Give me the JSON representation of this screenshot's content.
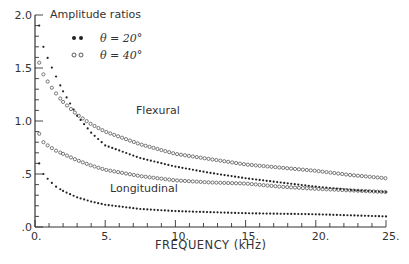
{
  "chart_data": {
    "type": "scatter",
    "title": "",
    "xlabel": "FREQUENCY (kHz)",
    "ylabel": "",
    "xlim": [
      0,
      25
    ],
    "ylim": [
      0,
      2.0
    ],
    "x_ticks": [
      0,
      5,
      10,
      15,
      20,
      25
    ],
    "x_tick_labels": [
      "0.",
      "5.",
      "10.",
      "15.",
      "20.",
      "25."
    ],
    "y_ticks": [
      0,
      0.5,
      1.0,
      1.5,
      2.0
    ],
    "y_tick_labels": [
      ".0",
      ".5",
      "1.0",
      "1.5",
      "2.0"
    ],
    "grid": false,
    "legend": {
      "title": "Amplitude ratios",
      "position": "upper-left",
      "entries": [
        {
          "marker": "filled",
          "label": "θ = 20°"
        },
        {
          "marker": "open",
          "label": "θ = 40°"
        }
      ]
    },
    "annotations": [
      {
        "text": "Flexural",
        "x": 8.8,
        "y": 1.0
      },
      {
        "text": "Longitudinal",
        "x": 8.8,
        "y": 0.33
      }
    ],
    "x": [
      0.3,
      0.6,
      1,
      1.5,
      2,
      3,
      4,
      5,
      7.5,
      10,
      12.5,
      15,
      17.5,
      20,
      22.5,
      25
    ],
    "series": [
      {
        "name": "Flexural, θ = 20°",
        "marker": "filled",
        "values": [
          1.9,
          1.7,
          1.56,
          1.42,
          1.28,
          1.05,
          0.89,
          0.77,
          0.65,
          0.57,
          0.51,
          0.46,
          0.42,
          0.38,
          0.35,
          0.33
        ]
      },
      {
        "name": "Flexural, θ = 40°",
        "marker": "open",
        "values": [
          1.55,
          1.44,
          1.35,
          1.26,
          1.18,
          1.06,
          0.97,
          0.9,
          0.78,
          0.69,
          0.64,
          0.59,
          0.56,
          0.53,
          0.49,
          0.46
        ]
      },
      {
        "name": "Longitudinal, θ = 20°",
        "marker": "filled",
        "values": [
          0.6,
          0.5,
          0.44,
          0.38,
          0.34,
          0.28,
          0.24,
          0.21,
          0.17,
          0.15,
          0.14,
          0.13,
          0.125,
          0.12,
          0.11,
          0.1
        ]
      },
      {
        "name": "Longitudinal, θ = 40°",
        "marker": "open",
        "values": [
          0.88,
          0.8,
          0.76,
          0.72,
          0.69,
          0.63,
          0.58,
          0.54,
          0.48,
          0.44,
          0.42,
          0.41,
          0.38,
          0.36,
          0.345,
          0.33
        ]
      }
    ]
  }
}
